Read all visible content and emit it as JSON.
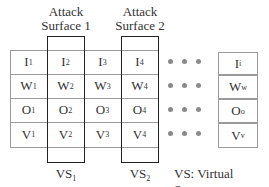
{
  "attack_surfaces": [
    {
      "line1": "Attack",
      "line2": "Surface 1"
    },
    {
      "line1": "Attack",
      "line2": "Surface 2"
    }
  ],
  "rows": [
    {
      "letter": "I",
      "subs": [
        "1",
        "2",
        "3",
        "4"
      ],
      "last_sub": "i"
    },
    {
      "letter": "W",
      "subs": [
        "1",
        "2",
        "3",
        "4"
      ],
      "last_sub": "w"
    },
    {
      "letter": "O",
      "subs": [
        "1",
        "2",
        "3",
        "4"
      ],
      "last_sub": "o"
    },
    {
      "letter": "V",
      "subs": [
        "1",
        "2",
        "3",
        "4"
      ],
      "last_sub": "v"
    }
  ],
  "ellipsis": "• • •",
  "vs_labels": [
    {
      "main": "VS",
      "sub": "1"
    },
    {
      "main": "VS",
      "sub": "2"
    }
  ],
  "legend": "VS: Virtual Server"
}
